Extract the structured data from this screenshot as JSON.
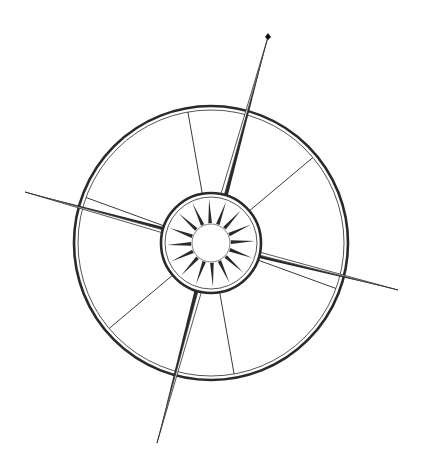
{
  "image": {
    "subject": "compass rose illustration",
    "width": 422,
    "height": 461,
    "background": "#ffffff",
    "ink": "#2a2a2a"
  },
  "compass": {
    "center": [
      211,
      243
    ],
    "outer_ring": {
      "r_outer": 137,
      "r_inner": 133
    },
    "inner_ring": {
      "r_outer": 50,
      "r_inner": 46
    },
    "hub_radius": 19,
    "rotation_deg": 20,
    "needles": [
      {
        "name": "north",
        "tip": [
          268,
          37
        ],
        "width": 7
      },
      {
        "name": "south",
        "tip": [
          157,
          443
        ],
        "width": 7
      },
      {
        "name": "west",
        "tip": [
          25,
          192
        ],
        "width": 6
      },
      {
        "name": "east",
        "tip": [
          398,
          290
        ],
        "width": 6
      }
    ],
    "spoke_count": 6,
    "spoke_angles_deg": [
      -120,
      -60,
      0,
      60,
      120,
      180
    ],
    "ray_count": 16,
    "north_marker": "small dark diamond at north tip"
  }
}
